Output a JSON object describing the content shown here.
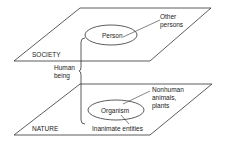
{
  "diagram": {
    "top_plane": {
      "label": "SOCIETY",
      "ellipse_label": "Person",
      "pointer_label_line1": "Other",
      "pointer_label_line2": "persons"
    },
    "bottom_plane": {
      "label": "NATURE",
      "ellipse_label": "Organism",
      "pointer_label_line1": "Nonhuman",
      "pointer_label_line2": "animals,",
      "pointer_label_line3": "plants",
      "bottom_label": "Inanimate entities"
    },
    "connector": {
      "label_line1": "Human",
      "label_line2": "being"
    }
  }
}
